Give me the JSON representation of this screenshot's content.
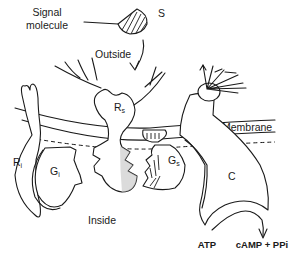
{
  "diagram": {
    "type": "membrane-signal-transduction",
    "labels": {
      "signal_molecule": "Signal\nmolecule",
      "signal_molecule_line1": "Signal",
      "signal_molecule_line2": "molecule",
      "s": "S",
      "outside": "Outside",
      "membrane": "Membrane",
      "inside": "Inside",
      "rs_main": "R",
      "rs_sub": "s",
      "ri_main": "R",
      "ri_sub": "i",
      "gi_main": "G",
      "gi_sub": "i",
      "gs_main": "G",
      "gs_sub": "s",
      "c": "C",
      "atp": "ATP",
      "products": "cAMP + PPi"
    },
    "components": [
      {
        "id": "S",
        "name": "Signal molecule",
        "style": "hatched"
      },
      {
        "id": "Rs",
        "name": "Stimulatory receptor",
        "location": "membrane-spanning"
      },
      {
        "id": "Ri",
        "name": "Inhibitory receptor",
        "location": "membrane-spanning"
      },
      {
        "id": "Gi",
        "name": "Inhibitory G protein",
        "location": "inside"
      },
      {
        "id": "Gs",
        "name": "Stimulatory G protein",
        "location": "inside",
        "style": "hatched"
      },
      {
        "id": "C",
        "name": "Catalytic unit (adenylate cyclase)",
        "location": "membrane-spanning"
      }
    ],
    "reaction": {
      "substrate": "ATP",
      "products": "cAMP + PPi"
    },
    "colors": {
      "ink": "#1a1a1a",
      "background": "#ffffff",
      "stipple": "#bdbdbd"
    }
  }
}
